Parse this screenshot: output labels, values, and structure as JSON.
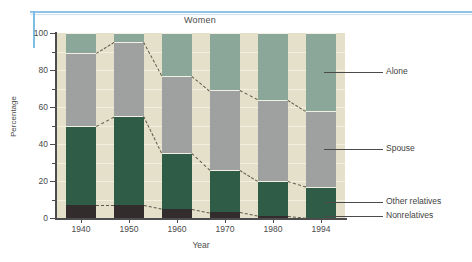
{
  "chart_data": {
    "type": "bar",
    "subtype": "stacked-bar-100-percent",
    "title": "Women",
    "xlabel": "Year",
    "ylabel": "Percentage",
    "categories": [
      "1940",
      "1950",
      "1960",
      "1970",
      "1980",
      "1994"
    ],
    "ylim": [
      0,
      100
    ],
    "yticks": [
      0,
      20,
      40,
      60,
      80,
      100
    ],
    "yticks_minor": [
      10,
      30,
      50,
      70,
      90
    ],
    "grid": true,
    "legend_position": "right",
    "series": [
      {
        "name": "Nonrelatives",
        "color": "#332c2c",
        "values": [
          7,
          7,
          5,
          3,
          1,
          0
        ]
      },
      {
        "name": "Other relatives",
        "color": "#2e5c47",
        "values": [
          43,
          48,
          30,
          23,
          19,
          17
        ]
      },
      {
        "name": "Spouse",
        "color": "#9fa0a0",
        "values": [
          39,
          40,
          42,
          43,
          44,
          41
        ]
      },
      {
        "name": "Alone",
        "color": "#8ba79a",
        "values": [
          11,
          5,
          23,
          31,
          36,
          42
        ]
      }
    ],
    "cumulative_tops": {
      "Nonrelatives": [
        7,
        7,
        5,
        3,
        1,
        0
      ],
      "Other relatives": [
        50,
        55,
        35,
        26,
        20,
        17
      ],
      "Spouse": [
        89,
        95,
        77,
        69,
        64,
        58
      ],
      "Alone": [
        100,
        100,
        100,
        100,
        100,
        100
      ]
    },
    "colors": {
      "alone": "#8ba79a",
      "spouse": "#9fa0a0",
      "other_relatives": "#2e5c47",
      "nonrelatives": "#332c2c",
      "plot_background": "#e4e0c9",
      "gridline": "#f4f1e2",
      "rule_blue": "#8fc4e8"
    }
  },
  "axis": {
    "y_labels": [
      "100",
      "80",
      "60",
      "40",
      "20",
      "0"
    ],
    "y_title": "Percentage",
    "x_title": "Year",
    "x_labels": [
      "1940",
      "1950",
      "1960",
      "1970",
      "1980",
      "1994"
    ]
  },
  "legend": {
    "items": [
      {
        "label": "Alone"
      },
      {
        "label": "Spouse"
      },
      {
        "label": "Other relatives"
      },
      {
        "label": "Nonrelatives"
      }
    ]
  }
}
